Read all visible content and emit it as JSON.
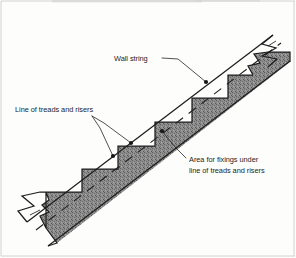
{
  "figure": {
    "kind": "technical-drawing",
    "background_color": "#fdfdfc",
    "ink_color": "#1d1d1d",
    "hatch_fill_color": "#8a8a8a"
  },
  "labels": {
    "wall_string": {
      "text": "Wall string",
      "x": 114,
      "y": 61,
      "anchor": "start"
    },
    "line_of_treads_and_risers": {
      "text": "Line of treads and risers",
      "x": 15,
      "y": 112,
      "anchor": "start"
    },
    "area_for_fixings": {
      "line1": "Area for fixings under",
      "line2": "line of treads and risers",
      "x": 189,
      "y": 162,
      "anchor": "start"
    }
  },
  "geometry": {
    "pitch_angle_description": "rising left to right",
    "step_count_visible": 5,
    "break_line_ends": [
      "bottom-left",
      "top-right"
    ],
    "dashed_line_name": "pitch line",
    "leader_endpoints": [
      {
        "name": "wall-string-dot",
        "x": 205,
        "y": 82
      },
      {
        "name": "treads-dot-upper",
        "x": 131,
        "y": 143
      },
      {
        "name": "treads-dot-lower",
        "x": 113,
        "y": 156
      },
      {
        "name": "fixings-dot",
        "x": 162,
        "y": 131
      }
    ]
  }
}
